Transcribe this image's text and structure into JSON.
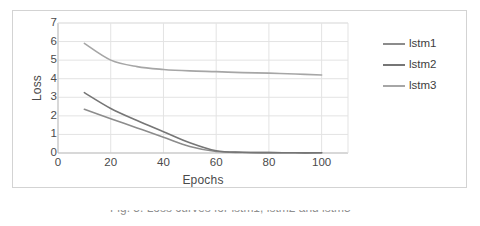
{
  "figure": {
    "caption_partial": "Fig. 5.  Loss curves for lstm1, lstm2 and lstm3"
  },
  "colors": {
    "series_1": "#8c8c8c",
    "series_2": "#767676",
    "series_3": "#a6a6a6",
    "gridline": "#e3e3e3",
    "axis_line": "#bfbfbf",
    "text": "#4a4a4a",
    "border": "#d3d3d3"
  },
  "chart_data": {
    "type": "line",
    "title": "",
    "xlabel": "Epochs",
    "ylabel": "Loss",
    "xlim": [
      0,
      110
    ],
    "ylim": [
      0,
      7
    ],
    "xticks": [
      0,
      20,
      40,
      60,
      80,
      100
    ],
    "yticks": [
      0,
      1,
      2,
      3,
      4,
      5,
      6,
      7
    ],
    "grid": "horizontal-and-vertical",
    "legend_position": "right",
    "x": [
      10,
      20,
      30,
      40,
      50,
      60,
      70,
      80,
      90,
      100
    ],
    "series": [
      {
        "name": "lstm1",
        "values": [
          2.35,
          1.85,
          1.35,
          0.85,
          0.35,
          0.08,
          0.03,
          0.02,
          0.01,
          0.01
        ]
      },
      {
        "name": "lstm2",
        "values": [
          3.25,
          2.4,
          1.75,
          1.15,
          0.55,
          0.12,
          0.04,
          0.02,
          0.01,
          0.01
        ]
      },
      {
        "name": "lstm3",
        "values": [
          5.9,
          5.0,
          4.65,
          4.5,
          4.42,
          4.38,
          4.33,
          4.3,
          4.25,
          4.2
        ]
      }
    ]
  },
  "legend": {
    "entries": [
      {
        "label": "lstm1"
      },
      {
        "label": "lstm2"
      },
      {
        "label": "lstm3"
      }
    ]
  }
}
